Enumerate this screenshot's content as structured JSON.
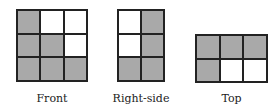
{
  "views": [
    {
      "label": "Front",
      "rows": 3,
      "cols": 3,
      "cells": [
        [
          "g",
          "w",
          "w"
        ],
        [
          "g",
          "g",
          "w"
        ],
        [
          "g",
          "g",
          "g"
        ]
      ]
    },
    {
      "label": "Right-side",
      "rows": 3,
      "cols": 2,
      "cells": [
        [
          "w",
          "g"
        ],
        [
          "w",
          "g"
        ],
        [
          "g",
          "g"
        ]
      ]
    },
    {
      "label": "Top",
      "rows": 2,
      "cols": 3,
      "cells": [
        [
          "g",
          "g",
          "g"
        ],
        [
          "g",
          "w",
          "w"
        ]
      ]
    }
  ],
  "colors": {
    "shaded": "#a9a9a9",
    "unshaded": "#ffffff",
    "line": "#222222"
  }
}
